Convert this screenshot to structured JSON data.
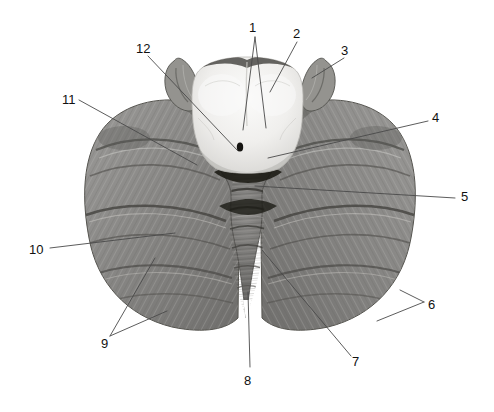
{
  "figure": {
    "background_color": "#ffffff",
    "width": 494,
    "height": 412,
    "leader_line_color": "#4a4a4a",
    "label_text_color": "#111111"
  },
  "specimen": {
    "description": "Grayscale photograph of a human cerebellum seen from above with the cut surface of the brainstem in the midline",
    "regions": [
      {
        "name": "brainstem-cut-surface",
        "tone": "#f2f1ef",
        "note": "bright white-grey cut face of the midbrain/pons in the midline"
      },
      {
        "name": "left-cerebellar-hemisphere",
        "tone": "#8d8d8c",
        "note": "folia-striated grey mass on the viewer's left"
      },
      {
        "name": "right-cerebellar-hemisphere",
        "tone": "#8d8d8c",
        "note": "folia-striated grey mass on the viewer's right"
      },
      {
        "name": "vermis",
        "tone": "#757473",
        "note": "narrow midline ridge between hemispheres"
      },
      {
        "name": "left-peduncle-flocculus",
        "tone": "#7a7978"
      },
      {
        "name": "right-peduncle-flocculus",
        "tone": "#7a7978"
      }
    ]
  },
  "labels": [
    {
      "id": "label-1",
      "text": "1",
      "x": 249,
      "y": 21
    },
    {
      "id": "label-2",
      "text": "2",
      "x": 293,
      "y": 27
    },
    {
      "id": "label-3",
      "text": "3",
      "x": 341,
      "y": 44
    },
    {
      "id": "label-4",
      "text": "4",
      "x": 432,
      "y": 111
    },
    {
      "id": "label-5",
      "text": "5",
      "x": 461,
      "y": 190
    },
    {
      "id": "label-6",
      "text": "6",
      "x": 428,
      "y": 298
    },
    {
      "id": "label-7",
      "text": "7",
      "x": 352,
      "y": 355
    },
    {
      "id": "label-8",
      "text": "8",
      "x": 244,
      "y": 374
    },
    {
      "id": "label-9",
      "text": "9",
      "x": 101,
      "y": 337
    },
    {
      "id": "label-10",
      "text": "10",
      "x": 29,
      "y": 243
    },
    {
      "id": "label-11",
      "text": "11",
      "x": 62,
      "y": 93
    },
    {
      "id": "label-12",
      "text": "12",
      "x": 136,
      "y": 42
    }
  ],
  "leaders": [
    {
      "for": "1",
      "path": "M 255 37 L 243 130"
    },
    {
      "for": "1b",
      "path": "M 255 37 L 266 128"
    },
    {
      "for": "2",
      "path": "M 297 42 L 270 92"
    },
    {
      "for": "3",
      "path": "M 344 58 L 312 78"
    },
    {
      "for": "4",
      "path": "M 428 121 L 268 158"
    },
    {
      "for": "5",
      "path": "M 455 198 L 255 186"
    },
    {
      "for": "6",
      "path": "M 424 302 L 400 290"
    },
    {
      "for": "6b",
      "path": "M 424 302 L 377 321"
    },
    {
      "for": "7",
      "path": "M 351 356 L 262 250"
    },
    {
      "for": "8",
      "path": "M 250 367 L 248 292"
    },
    {
      "for": "9",
      "path": "M 110 336 L 155 258"
    },
    {
      "for": "9b",
      "path": "M 110 336 L 167 311"
    },
    {
      "for": "10",
      "path": "M 50 248 L 175 233"
    },
    {
      "for": "11",
      "path": "M 79 100 L 197 165"
    },
    {
      "for": "12",
      "path": "M 148 56 L 238 151"
    }
  ]
}
